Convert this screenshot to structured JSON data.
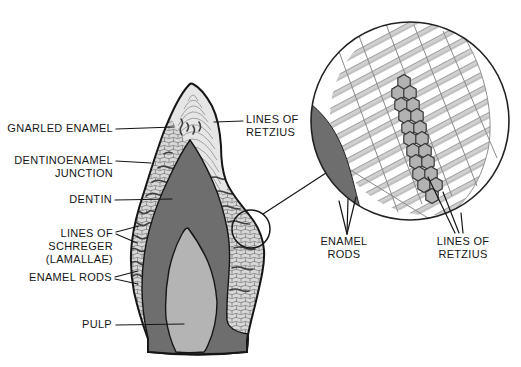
{
  "labels": {
    "gnarled_enamel": "GNARLED ENAMEL",
    "dentinoenamel_line1": "DENTINOENAMEL",
    "dentinoenamel_line2": "JUNCTION",
    "dentin": "DENTIN",
    "schreger_line1": "LINES OF",
    "schreger_line2": "SCHREGER",
    "schreger_line3": "(LAMALLAE)",
    "enamel_rods": "ENAMEL RODS",
    "pulp": "PULP",
    "retzius_tooth_line1": "LINES OF",
    "retzius_tooth_line2": "RETZIUS",
    "inset_enamel_rods_line1": "ENAMEL",
    "inset_enamel_rods_line2": "RODS",
    "inset_retzius_line1": "LINES OF",
    "inset_retzius_line2": "RETZIUS"
  },
  "colors": {
    "dentin": "#6e6e6e",
    "pulp": "#b4b4b4",
    "enamel_base": "#e6e6e6",
    "outline": "#161616",
    "stripe_gray": "#d0d0d0",
    "stripe_line": "#8f8f8f",
    "hexagon_fill": "#b2b2b2",
    "schreger_band": "#3f3f3f",
    "label_text": "#161616"
  }
}
